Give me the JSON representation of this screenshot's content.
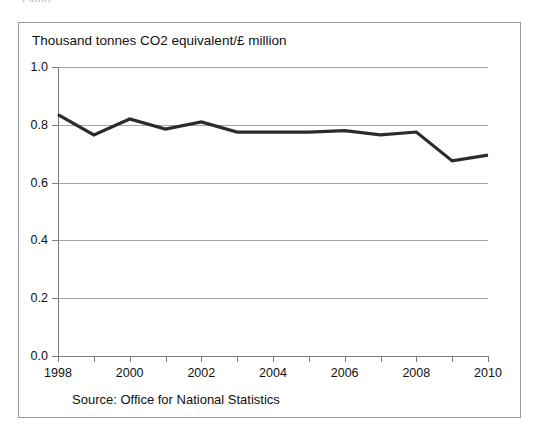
{
  "top_clipped_text": "Figure",
  "chart_title": "Thousand tonnes CO2 equivalent/£ million",
  "source_note": "Source: Office for National Statistics",
  "axis": {
    "y_tick_labels": [
      "1.0",
      "0.8",
      "0.6",
      "0.4",
      "0.2",
      "0.0"
    ],
    "x_tick_labels": [
      "1998",
      "2000",
      "2002",
      "2004",
      "2006",
      "2008",
      "2010"
    ]
  },
  "chart_data": {
    "type": "line",
    "title": "Thousand tonnes CO2 equivalent/£ million",
    "xlabel": "",
    "ylabel": "Thousand tonnes CO2 equivalent/£ million",
    "xlim": [
      1998,
      2010
    ],
    "ylim": [
      0.0,
      1.0
    ],
    "ytick_values": [
      1.0,
      0.8,
      0.6,
      0.4,
      0.2,
      0.0
    ],
    "xtick_values": [
      1998,
      1999,
      2000,
      2001,
      2002,
      2003,
      2004,
      2005,
      2006,
      2007,
      2008,
      2009,
      2010
    ],
    "xtick_labeled": [
      1998,
      2000,
      2002,
      2004,
      2006,
      2008,
      2010
    ],
    "grid": "horizontal",
    "legend": "none",
    "line_color": "#2b2b2b",
    "x": [
      1998,
      1999,
      2000,
      2001,
      2002,
      2003,
      2004,
      2005,
      2006,
      2007,
      2008,
      2009,
      2010
    ],
    "values": [
      0.835,
      0.765,
      0.82,
      0.785,
      0.81,
      0.775,
      0.775,
      0.775,
      0.78,
      0.765,
      0.775,
      0.675,
      0.695
    ],
    "series": [
      {
        "name": "Greenhouse gas emissions intensity",
        "values": [
          0.835,
          0.765,
          0.82,
          0.785,
          0.81,
          0.775,
          0.775,
          0.775,
          0.78,
          0.765,
          0.775,
          0.675,
          0.695
        ]
      }
    ]
  }
}
